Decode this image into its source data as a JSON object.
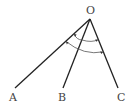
{
  "diagram": {
    "type": "geometry-angles",
    "vertex": {
      "label": "O",
      "x": 90,
      "y": 19
    },
    "rays": [
      {
        "label": "A",
        "end": [
          15,
          88
        ],
        "label_pos": [
          13,
          101
        ]
      },
      {
        "label": "B",
        "end": [
          63,
          88
        ],
        "label_pos": [
          62,
          101
        ]
      },
      {
        "label": "C",
        "end": [
          118,
          88
        ],
        "label_pos": [
          121,
          101
        ]
      }
    ],
    "angle_marks": [
      {
        "name": "angle-AOB",
        "from": "A",
        "to": "B",
        "radius": 22
      },
      {
        "name": "angle-BOC",
        "from": "B",
        "to": "C",
        "radius": 22
      },
      {
        "name": "angle-AOC",
        "from": "A",
        "to": "C",
        "radius": 33
      }
    ],
    "colors": {
      "line": "#222222",
      "arc": "#555555",
      "label": "#444444"
    }
  }
}
